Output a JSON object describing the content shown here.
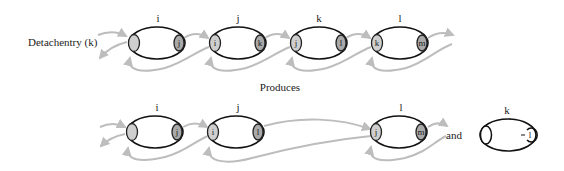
{
  "caption": {
    "operation": "Detachentry (k)",
    "produces": "Produces",
    "and": "and"
  },
  "colors": {
    "link": "#bdbdbd",
    "left_cell": "#cfcfcf",
    "right_cell": "#a9a9a9",
    "outline": "#111111"
  },
  "before": {
    "nodes": [
      {
        "name": "i",
        "left": "",
        "right": "j"
      },
      {
        "name": "j",
        "left": "i",
        "right": "k"
      },
      {
        "name": "k",
        "left": "j",
        "right": "l"
      },
      {
        "name": "l",
        "left": "k",
        "right": "m"
      }
    ]
  },
  "after": {
    "nodes": [
      {
        "name": "i",
        "left": "",
        "right": "j"
      },
      {
        "name": "j",
        "left": "i",
        "right": "l"
      },
      {
        "name": "l",
        "left": "j",
        "right": "m"
      }
    ],
    "detached": {
      "name": "k",
      "left": "",
      "right": "l"
    }
  }
}
